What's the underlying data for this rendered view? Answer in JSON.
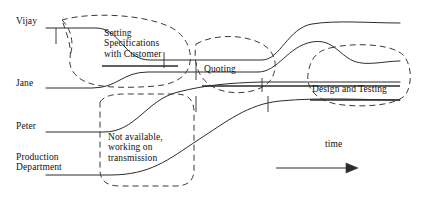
{
  "diagram": {
    "type": "timeline-swimlane",
    "canvas": {
      "width": 421,
      "height": 200
    },
    "stroke_color": "#2b2b2b",
    "dashed_color": "#3a3a3a",
    "background": "#ffffff"
  },
  "actors": [
    {
      "id": "vijay",
      "label": "Vijay",
      "lane_y": 28
    },
    {
      "id": "jane",
      "label": "Jane",
      "lane_y": 88
    },
    {
      "id": "peter",
      "label": "Peter",
      "lane_y": 132
    },
    {
      "id": "production",
      "label": "Production\nDepartment",
      "lane_y": 175
    }
  ],
  "activities": [
    {
      "id": "setting-specs",
      "label": "Setting\nSpecifications\nwith Customer",
      "underlined": true
    },
    {
      "id": "quoting",
      "label": "Quoting",
      "underlined": true
    },
    {
      "id": "not-available",
      "label": "Not available,\nworking on\ntransmission",
      "underlined": false
    },
    {
      "id": "design-testing",
      "label": "Design and Testing",
      "underlined": true
    }
  ],
  "axis": {
    "label": "time",
    "direction": "left-to-right",
    "arrow": true
  },
  "groupings": [
    {
      "id": "group-setting-specs",
      "encloses": [
        "vijay",
        "jane"
      ],
      "style": "dashed-blob"
    },
    {
      "id": "group-quoting",
      "encloses": [
        "vijay",
        "jane"
      ],
      "style": "dashed-blob"
    },
    {
      "id": "group-not-available",
      "encloses": [
        "peter",
        "production"
      ],
      "style": "dashed-blob"
    },
    {
      "id": "group-design",
      "encloses": [
        "peter",
        "production"
      ],
      "style": "dashed-blob"
    }
  ]
}
